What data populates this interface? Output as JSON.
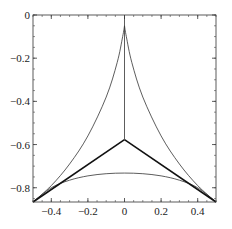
{
  "chart_data": {
    "type": "line",
    "title": "",
    "xlabel": "",
    "ylabel": "",
    "xlim": [
      -0.5,
      0.5
    ],
    "ylim": [
      -0.866,
      0
    ],
    "grid": false,
    "legend": null,
    "x_ticks": [
      {
        "value": -0.4,
        "label": "-0.4"
      },
      {
        "value": -0.2,
        "label": "-0.2"
      },
      {
        "value": 0,
        "label": "0"
      },
      {
        "value": 0.2,
        "label": "0.2"
      },
      {
        "value": 0.4,
        "label": "0.4"
      }
    ],
    "y_ticks": [
      {
        "value": 0,
        "label": "0"
      },
      {
        "value": -0.2,
        "label": "-0.2"
      },
      {
        "value": -0.4,
        "label": "-0.4"
      },
      {
        "value": -0.6,
        "label": "-0.6"
      },
      {
        "value": -0.8,
        "label": "-0.8"
      }
    ],
    "series": [
      {
        "name": "left-concave-arc",
        "style": "thin",
        "points": [
          [
            -0.5,
            -0.866
          ],
          [
            -0.4,
            -0.79
          ],
          [
            -0.3,
            -0.69
          ],
          [
            -0.2,
            -0.56
          ],
          [
            -0.1,
            -0.38
          ],
          [
            -0.04,
            -0.22
          ],
          [
            -0.01,
            -0.1
          ],
          [
            0,
            -0.05
          ]
        ]
      },
      {
        "name": "right-concave-arc",
        "style": "thin",
        "points": [
          [
            0.5,
            -0.866
          ],
          [
            0.4,
            -0.79
          ],
          [
            0.3,
            -0.69
          ],
          [
            0.2,
            -0.56
          ],
          [
            0.1,
            -0.38
          ],
          [
            0.04,
            -0.22
          ],
          [
            0.01,
            -0.1
          ],
          [
            0,
            -0.05
          ]
        ]
      },
      {
        "name": "bottom-arc",
        "style": "thin",
        "points": [
          [
            -0.5,
            -0.866
          ],
          [
            -0.4,
            -0.8
          ],
          [
            -0.3,
            -0.765
          ],
          [
            -0.2,
            -0.745
          ],
          [
            -0.1,
            -0.735
          ],
          [
            0,
            -0.732
          ],
          [
            0.1,
            -0.735
          ],
          [
            0.2,
            -0.745
          ],
          [
            0.3,
            -0.765
          ],
          [
            0.4,
            -0.8
          ],
          [
            0.5,
            -0.866
          ]
        ]
      },
      {
        "name": "left-spoke",
        "style": "thick",
        "points": [
          [
            -0.5,
            -0.866
          ],
          [
            0,
            -0.577
          ]
        ]
      },
      {
        "name": "right-spoke",
        "style": "thick",
        "points": [
          [
            0.5,
            -0.866
          ],
          [
            0,
            -0.577
          ]
        ]
      },
      {
        "name": "vertical-stem",
        "style": "thin",
        "points": [
          [
            0,
            -0.577
          ],
          [
            0,
            0
          ]
        ]
      }
    ],
    "annotations": []
  }
}
